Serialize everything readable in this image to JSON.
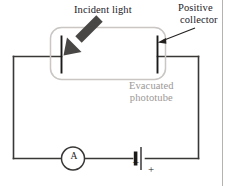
{
  "figure": {
    "canvas": {
      "width": 230,
      "height": 186,
      "background": "#ffffff"
    },
    "labels": {
      "incident_light": "Incident light",
      "positive_collector_line1": "Positive",
      "positive_collector_line2": "collector",
      "evacuated_line1": "Evacuated",
      "evacuated_line2": "phototube",
      "ammeter_symbol": "A",
      "battery_negative": "–",
      "battery_positive": "+"
    },
    "colors": {
      "wire": "#3a3836",
      "tube_outline": "#c9c6c4",
      "electrode": "#1c1a19",
      "arrow": "#494745",
      "text_dark": "#23201f",
      "text_gray": "#9b9795",
      "border": "#b5b2b0"
    },
    "components": [
      {
        "name": "evacuated-phototube",
        "type": "rounded-rect"
      },
      {
        "name": "emitter-electrode",
        "type": "plate"
      },
      {
        "name": "collector-electrode",
        "type": "plate"
      },
      {
        "name": "incident-light-arrow",
        "type": "arrow"
      },
      {
        "name": "ammeter",
        "type": "circle-meter"
      },
      {
        "name": "battery",
        "type": "cell"
      },
      {
        "name": "circuit-wire",
        "type": "loop"
      }
    ]
  }
}
